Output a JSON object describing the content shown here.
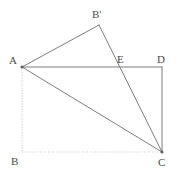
{
  "figure": {
    "width": 182,
    "height": 176,
    "background_color": "#ffffff",
    "solid_stroke_color": "#6e6e6e",
    "dotted_stroke_color": "#c2c2c2",
    "label_color": "#4a4a4a"
  },
  "points": {
    "A": {
      "label": "A",
      "x": 22,
      "y": 67,
      "label_x": 9,
      "label_y": 55
    },
    "B": {
      "label": "B",
      "x": 22,
      "y": 152,
      "label_x": 11,
      "label_y": 156
    },
    "C": {
      "label": "C",
      "x": 162,
      "y": 152,
      "label_x": 158,
      "label_y": 157
    },
    "D": {
      "label": "D",
      "x": 162,
      "y": 67,
      "label_x": 157,
      "label_y": 54
    },
    "E": {
      "label": "E",
      "x": 117,
      "y": 67,
      "label_x": 117,
      "label_y": 54
    },
    "Bp": {
      "label": "B'",
      "x": 99,
      "y": 25,
      "label_x": 92,
      "label_y": 9
    }
  },
  "segments": [
    {
      "name": "segment-AD",
      "from": "A",
      "to": "D",
      "style": "solid"
    },
    {
      "name": "segment-DC",
      "from": "D",
      "to": "C",
      "style": "solid"
    },
    {
      "name": "segment-AB-prime",
      "from": "A",
      "to": "Bp",
      "style": "solid"
    },
    {
      "name": "segment-B-prime-C",
      "from": "Bp",
      "to": "C",
      "style": "solid"
    },
    {
      "name": "segment-AC",
      "from": "A",
      "to": "C",
      "style": "solid"
    },
    {
      "name": "segment-AB",
      "from": "A",
      "to": "B",
      "style": "dotted"
    },
    {
      "name": "segment-BC",
      "from": "B",
      "to": "C",
      "style": "dotted"
    }
  ],
  "vertex_dots": [
    "A",
    "C"
  ]
}
